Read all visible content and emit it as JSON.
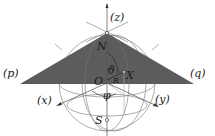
{
  "diagram": {
    "labels": {
      "z_axis": "(z)",
      "x_axis": "(x)",
      "y_axis": "(y)",
      "p_point": "(p)",
      "q_point": "(q)",
      "north": "N",
      "south": "S",
      "origin": "O",
      "point_x": "X",
      "theta": "ϑ",
      "radius": "R",
      "phi": "φ"
    },
    "colors": {
      "triangle_fill": "#5c5c5c",
      "sphere_lines": "#8a8a8a",
      "text": "#1a1a1a",
      "background": "#ffffff"
    }
  }
}
